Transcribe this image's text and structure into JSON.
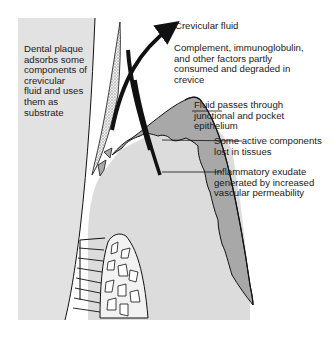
{
  "figure": {
    "colors": {
      "background": "#ffffff",
      "tooth_light_gray": "#e3e3e3",
      "soft_tissue_gray": "#dcdcdc",
      "epithelium_dark_gray": "#a9a9a9",
      "outline": "#111111",
      "plaque_stipple": "#888888"
    }
  },
  "labels": {
    "plaque": "Dental plaque\nadsorbs some\ncomponents of\ncrevicular\nfluid and uses\nthem as\nsubstrate",
    "crevicular_fluid": "Crevicular fluid",
    "complement": "Complement, immunoglobulin,\nand other factors partly\nconsumed and degraded in\ncrevice",
    "fluid_passes": "Fluid passes through\njunctional and pocket\nepithelium",
    "active_components": "Some active components\nlost in tissues",
    "inflammatory": "Inflammatory exudate\ngenerated by increased\nvascular permeability"
  }
}
